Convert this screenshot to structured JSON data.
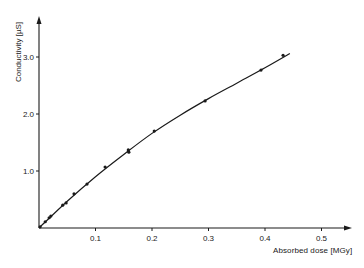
{
  "chart_data": {
    "type": "scatter",
    "title": "",
    "xlabel": "Absorbed dose [MGy]",
    "ylabel": "Conductivity [µS]",
    "xlim": [
      0,
      0.55
    ],
    "ylim": [
      0,
      3.5
    ],
    "x_ticks": [
      0.1,
      0.2,
      0.3,
      0.4,
      0.5
    ],
    "x_tick_labels": [
      "0.1",
      "0.2",
      "0.3",
      "0.4",
      "0.5"
    ],
    "y_ticks": [
      1.0,
      2.0,
      3.0
    ],
    "y_tick_labels": [
      "1.0",
      "2.0",
      "3.0"
    ],
    "grid": false,
    "legend": null,
    "series": [
      {
        "name": "measured",
        "kind": "points",
        "x": [
          0.002,
          0.011,
          0.018,
          0.021,
          0.042,
          0.048,
          0.062,
          0.085,
          0.117,
          0.158,
          0.159,
          0.204,
          0.294,
          0.393,
          0.432
        ],
        "y": [
          0.02,
          0.11,
          0.18,
          0.21,
          0.4,
          0.44,
          0.6,
          0.77,
          1.07,
          1.37,
          1.33,
          1.7,
          2.23,
          2.77,
          3.03
        ]
      },
      {
        "name": "fitted curve",
        "kind": "line",
        "x": [
          0,
          0.05,
          0.1,
          0.15,
          0.2,
          0.25,
          0.3,
          0.35,
          0.4,
          0.444
        ],
        "y": [
          0,
          0.47,
          0.9,
          1.29,
          1.66,
          1.98,
          2.27,
          2.54,
          2.81,
          3.06
        ]
      }
    ]
  },
  "axes": {
    "x_title": "Absorbed dose [MGy]",
    "y_title": "Conductivity [µS]"
  },
  "colors": {
    "ink": "#1a1a1a",
    "background": "#ffffff"
  }
}
